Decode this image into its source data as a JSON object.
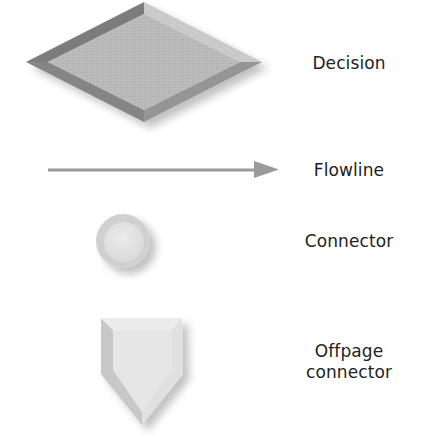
{
  "diagram": {
    "type": "flowchart-symbol-legend",
    "symbols": [
      {
        "id": "decision",
        "shape": "diamond",
        "label": "Decision"
      },
      {
        "id": "flowline",
        "shape": "arrow",
        "label": "Flowline"
      },
      {
        "id": "connector",
        "shape": "circle",
        "label": "Connector"
      },
      {
        "id": "offpage",
        "shape": "pentagon-pointer",
        "label_line1": "Offpage",
        "label_line2": "connector"
      }
    ],
    "colors": {
      "decision_face": "#b5b5b5",
      "decision_bevel_dark": "#7c7c7c",
      "decision_bevel_light": "#cacaca",
      "decision_bevel_mid": "#959595",
      "flowline": "#9a9a9a",
      "connector_outer": "#d2d2d2",
      "connector_inner": "#e4e4e4",
      "offpage_face": "#e6e6e6",
      "offpage_bevel": "#cfcfcf",
      "label_text": "#222222"
    }
  }
}
